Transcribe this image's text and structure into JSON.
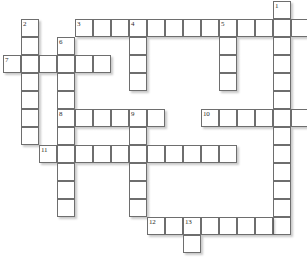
{
  "puzzle": {
    "title": "Crossword Grid",
    "grid": {
      "origin_x": 3,
      "origin_y": 1,
      "cell_size": 18,
      "columns": 17,
      "rows": 14,
      "cell_fill": "#ffffff",
      "cell_border": "#6e6e6e",
      "page_background": "#ffffff",
      "number_color": "#2b2b2b"
    },
    "numbers_visible": [
      "1",
      "2",
      "3",
      "4",
      "5",
      "6",
      "7",
      "8",
      "9",
      "10",
      "11",
      "12",
      "13"
    ],
    "entries": [
      {
        "number": "1",
        "direction": "down",
        "col": 15,
        "row": 0,
        "length": 14
      },
      {
        "number": "2",
        "direction": "down",
        "col": 1,
        "row": 1,
        "length": 8
      },
      {
        "number": "3",
        "direction": "across",
        "col": 4,
        "row": 1,
        "length": 12
      },
      {
        "number": "4",
        "direction": "down",
        "col": 7,
        "row": 1,
        "length": 5
      },
      {
        "number": "5",
        "direction": "down",
        "col": 12,
        "row": 1,
        "length": 4
      },
      {
        "number": "6",
        "direction": "down",
        "col": 3,
        "row": 2,
        "length": 10
      },
      {
        "number": "7",
        "direction": "across",
        "col": 0,
        "row": 3,
        "length": 6
      },
      {
        "number": "8",
        "direction": "across",
        "col": 3,
        "row": 6,
        "length": 6
      },
      {
        "number": "9",
        "direction": "down",
        "col": 7,
        "row": 6,
        "length": 6
      },
      {
        "number": "10",
        "direction": "across",
        "col": 11,
        "row": 6,
        "length": 6
      },
      {
        "number": "11",
        "direction": "across",
        "col": 2,
        "row": 8,
        "length": 11
      },
      {
        "number": "12",
        "direction": "across",
        "col": 8,
        "row": 12,
        "length": 8
      },
      {
        "number": "13",
        "direction": "down",
        "col": 10,
        "row": 12,
        "length": 2
      }
    ],
    "cells": [
      {
        "col": 15,
        "row": 0,
        "num": "1",
        "letter": ""
      },
      {
        "col": 1,
        "row": 1,
        "num": "2",
        "letter": ""
      },
      {
        "col": 4,
        "row": 1,
        "num": "3",
        "letter": ""
      },
      {
        "col": 5,
        "row": 1,
        "num": "",
        "letter": ""
      },
      {
        "col": 6,
        "row": 1,
        "num": "",
        "letter": ""
      },
      {
        "col": 7,
        "row": 1,
        "num": "4",
        "letter": ""
      },
      {
        "col": 8,
        "row": 1,
        "num": "",
        "letter": ""
      },
      {
        "col": 9,
        "row": 1,
        "num": "",
        "letter": ""
      },
      {
        "col": 10,
        "row": 1,
        "num": "",
        "letter": ""
      },
      {
        "col": 11,
        "row": 1,
        "num": "",
        "letter": ""
      },
      {
        "col": 12,
        "row": 1,
        "num": "5",
        "letter": ""
      },
      {
        "col": 13,
        "row": 1,
        "num": "",
        "letter": ""
      },
      {
        "col": 14,
        "row": 1,
        "num": "",
        "letter": ""
      },
      {
        "col": 15,
        "row": 1,
        "num": "",
        "letter": ""
      },
      {
        "col": 16,
        "row": 1,
        "num": "",
        "letter": ""
      },
      {
        "col": 1,
        "row": 2,
        "num": "",
        "letter": ""
      },
      {
        "col": 3,
        "row": 2,
        "num": "6",
        "letter": ""
      },
      {
        "col": 7,
        "row": 2,
        "num": "",
        "letter": ""
      },
      {
        "col": 12,
        "row": 2,
        "num": "",
        "letter": ""
      },
      {
        "col": 15,
        "row": 2,
        "num": "",
        "letter": ""
      },
      {
        "col": 0,
        "row": 3,
        "num": "7",
        "letter": ""
      },
      {
        "col": 1,
        "row": 3,
        "num": "",
        "letter": ""
      },
      {
        "col": 2,
        "row": 3,
        "num": "",
        "letter": ""
      },
      {
        "col": 3,
        "row": 3,
        "num": "",
        "letter": ""
      },
      {
        "col": 4,
        "row": 3,
        "num": "",
        "letter": ""
      },
      {
        "col": 5,
        "row": 3,
        "num": "",
        "letter": ""
      },
      {
        "col": 7,
        "row": 3,
        "num": "",
        "letter": ""
      },
      {
        "col": 12,
        "row": 3,
        "num": "",
        "letter": ""
      },
      {
        "col": 15,
        "row": 3,
        "num": "",
        "letter": ""
      },
      {
        "col": 1,
        "row": 4,
        "num": "",
        "letter": ""
      },
      {
        "col": 3,
        "row": 4,
        "num": "",
        "letter": ""
      },
      {
        "col": 7,
        "row": 4,
        "num": "",
        "letter": ""
      },
      {
        "col": 12,
        "row": 4,
        "num": "",
        "letter": ""
      },
      {
        "col": 15,
        "row": 4,
        "num": "",
        "letter": ""
      },
      {
        "col": 1,
        "row": 5,
        "num": "",
        "letter": ""
      },
      {
        "col": 3,
        "row": 5,
        "num": "",
        "letter": ""
      },
      {
        "col": 15,
        "row": 5,
        "num": "",
        "letter": ""
      },
      {
        "col": 1,
        "row": 6,
        "num": "",
        "letter": ""
      },
      {
        "col": 3,
        "row": 6,
        "num": "8",
        "letter": ""
      },
      {
        "col": 4,
        "row": 6,
        "num": "",
        "letter": ""
      },
      {
        "col": 5,
        "row": 6,
        "num": "",
        "letter": ""
      },
      {
        "col": 6,
        "row": 6,
        "num": "",
        "letter": ""
      },
      {
        "col": 7,
        "row": 6,
        "num": "9",
        "letter": ""
      },
      {
        "col": 8,
        "row": 6,
        "num": "",
        "letter": ""
      },
      {
        "col": 11,
        "row": 6,
        "num": "10",
        "letter": ""
      },
      {
        "col": 12,
        "row": 6,
        "num": "",
        "letter": ""
      },
      {
        "col": 13,
        "row": 6,
        "num": "",
        "letter": ""
      },
      {
        "col": 14,
        "row": 6,
        "num": "",
        "letter": ""
      },
      {
        "col": 15,
        "row": 6,
        "num": "",
        "letter": ""
      },
      {
        "col": 16,
        "row": 6,
        "num": "",
        "letter": ""
      },
      {
        "col": 1,
        "row": 7,
        "num": "",
        "letter": ""
      },
      {
        "col": 3,
        "row": 7,
        "num": "",
        "letter": ""
      },
      {
        "col": 7,
        "row": 7,
        "num": "",
        "letter": ""
      },
      {
        "col": 15,
        "row": 7,
        "num": "",
        "letter": ""
      },
      {
        "col": 2,
        "row": 8,
        "num": "11",
        "letter": ""
      },
      {
        "col": 3,
        "row": 8,
        "num": "",
        "letter": ""
      },
      {
        "col": 4,
        "row": 8,
        "num": "",
        "letter": ""
      },
      {
        "col": 5,
        "row": 8,
        "num": "",
        "letter": ""
      },
      {
        "col": 6,
        "row": 8,
        "num": "",
        "letter": ""
      },
      {
        "col": 7,
        "row": 8,
        "num": "",
        "letter": ""
      },
      {
        "col": 8,
        "row": 8,
        "num": "",
        "letter": ""
      },
      {
        "col": 9,
        "row": 8,
        "num": "",
        "letter": ""
      },
      {
        "col": 10,
        "row": 8,
        "num": "",
        "letter": ""
      },
      {
        "col": 11,
        "row": 8,
        "num": "",
        "letter": ""
      },
      {
        "col": 12,
        "row": 8,
        "num": "",
        "letter": ""
      },
      {
        "col": 15,
        "row": 8,
        "num": "",
        "letter": ""
      },
      {
        "col": 3,
        "row": 9,
        "num": "",
        "letter": ""
      },
      {
        "col": 7,
        "row": 9,
        "num": "",
        "letter": ""
      },
      {
        "col": 15,
        "row": 9,
        "num": "",
        "letter": ""
      },
      {
        "col": 3,
        "row": 10,
        "num": "",
        "letter": ""
      },
      {
        "col": 7,
        "row": 10,
        "num": "",
        "letter": ""
      },
      {
        "col": 15,
        "row": 10,
        "num": "",
        "letter": ""
      },
      {
        "col": 3,
        "row": 11,
        "num": "",
        "letter": ""
      },
      {
        "col": 7,
        "row": 11,
        "num": "",
        "letter": ""
      },
      {
        "col": 15,
        "row": 11,
        "num": "",
        "letter": ""
      },
      {
        "col": 15,
        "row": 12,
        "num": "",
        "letter": ""
      },
      {
        "col": 8,
        "row": 12,
        "num": "12",
        "letter": ""
      },
      {
        "col": 9,
        "row": 12,
        "num": "",
        "letter": ""
      },
      {
        "col": 10,
        "row": 12,
        "num": "13",
        "letter": ""
      },
      {
        "col": 11,
        "row": 12,
        "num": "",
        "letter": ""
      },
      {
        "col": 12,
        "row": 12,
        "num": "",
        "letter": ""
      },
      {
        "col": 13,
        "row": 12,
        "num": "",
        "letter": ""
      },
      {
        "col": 14,
        "row": 12,
        "num": "",
        "letter": ""
      },
      {
        "col": 10,
        "row": 13,
        "num": "",
        "letter": ""
      }
    ]
  }
}
